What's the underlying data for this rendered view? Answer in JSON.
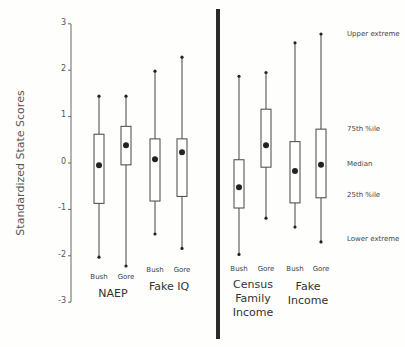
{
  "chart_data": {
    "type": "boxplot",
    "title": "",
    "ylabel": "Standardized State Scores",
    "xlabel": "",
    "ylim": [
      -3,
      3
    ],
    "yticks": [
      3,
      2,
      1,
      0,
      -1,
      -2,
      -3
    ],
    "grid": false,
    "legend": null,
    "panels": [
      {
        "name": "left",
        "groups": [
          {
            "label": "NAEP",
            "boxes": [
              {
                "candidate": "Bush",
                "upper_extreme": 1.44,
                "q75": 0.62,
                "median": -0.05,
                "q25": -0.87,
                "lower_extreme": -2.03
              },
              {
                "candidate": "Gore",
                "upper_extreme": 1.44,
                "q75": 0.79,
                "median": 0.38,
                "q25": -0.04,
                "lower_extreme": -2.22
              }
            ]
          },
          {
            "label": "Fake IQ",
            "boxes": [
              {
                "candidate": "Bush",
                "upper_extreme": 1.98,
                "q75": 0.52,
                "median": 0.08,
                "q25": -0.82,
                "lower_extreme": -1.53
              },
              {
                "candidate": "Gore",
                "upper_extreme": 2.28,
                "q75": 0.52,
                "median": 0.23,
                "q25": -0.72,
                "lower_extreme": -1.84
              }
            ]
          }
        ]
      },
      {
        "name": "right",
        "groups": [
          {
            "label": "Census Family Income",
            "label_lines": [
              "Census",
              "Family",
              "Income"
            ],
            "boxes": [
              {
                "candidate": "Bush",
                "upper_extreme": 1.87,
                "q75": 0.07,
                "median": -0.52,
                "q25": -0.97,
                "lower_extreme": -1.97
              },
              {
                "candidate": "Gore",
                "upper_extreme": 1.95,
                "q75": 1.16,
                "median": 0.38,
                "q25": -0.09,
                "lower_extreme": -1.19
              }
            ]
          },
          {
            "label": "Fake Income",
            "label_lines": [
              "Fake",
              "Income"
            ],
            "boxes": [
              {
                "candidate": "Bush",
                "upper_extreme": 2.59,
                "q75": 0.46,
                "median": -0.17,
                "q25": -0.86,
                "lower_extreme": -1.38
              },
              {
                "candidate": "Gore",
                "upper_extreme": 2.78,
                "q75": 0.73,
                "median": -0.04,
                "q25": -0.75,
                "lower_extreme": -1.7
              }
            ]
          }
        ]
      }
    ],
    "annotations": [
      {
        "text": "Upper extreme",
        "applies_to": "upper_extreme"
      },
      {
        "text": "75th %ile",
        "applies_to": "q75"
      },
      {
        "text": "Median",
        "applies_to": "median"
      },
      {
        "text": "25th %ile",
        "applies_to": "q25"
      },
      {
        "text": "Lower extreme",
        "applies_to": "lower_extreme"
      }
    ]
  },
  "labels": {
    "ylabel": "Standardized State Scores",
    "ticks": [
      "3",
      "2",
      "1",
      "0",
      "-1",
      "-2",
      "-3"
    ],
    "candidates": [
      "Bush",
      "Gore"
    ],
    "groups": {
      "naep": "NAEP",
      "fake_iq": "Fake IQ",
      "census_l1": "Census",
      "census_l2": "Family",
      "census_l3": "Income",
      "fake_income_l1": "Fake",
      "fake_income_l2": "Income"
    },
    "annotations": {
      "upper": "Upper extreme",
      "q75": "75th %ile",
      "median": "Median",
      "q25": "25th %ile",
      "lower": "Lower extreme"
    }
  },
  "colors": {
    "axis": "#555555",
    "box": "#444444",
    "divider": "#2a2a2a",
    "background": "#fefefc"
  }
}
